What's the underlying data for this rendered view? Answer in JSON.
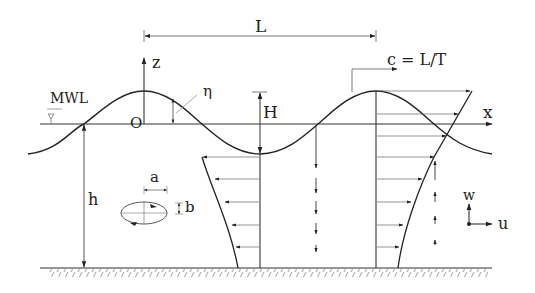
{
  "diagram": {
    "labels": {
      "wavelength": "L",
      "vertical_axis": "z",
      "horizontal_axis": "x",
      "surface_elevation": "η",
      "origin": "O",
      "mean_water_level": "MWL",
      "wave_height": "H",
      "celerity": "c = L/T",
      "water_depth": "h",
      "ellipse_horizontal": "a",
      "ellipse_vertical": "b",
      "legend_vertical_velocity": "w",
      "legend_horizontal_velocity": "u"
    },
    "colors": {
      "line": "#222222",
      "thin_line": "#555555",
      "background": "#ffffff"
    }
  }
}
